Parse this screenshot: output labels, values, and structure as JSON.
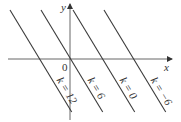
{
  "figure": {
    "type": "family of parallel lines",
    "axes": {
      "x_label": "x",
      "y_label": "y",
      "origin_label": "0"
    },
    "lines": [
      {
        "k_label": "k = 12",
        "k": 12
      },
      {
        "k_label": "k = 6",
        "k": 6
      },
      {
        "k_label": "k = 0",
        "k": 0
      },
      {
        "k_label": "k = −6",
        "k": -6
      }
    ]
  }
}
